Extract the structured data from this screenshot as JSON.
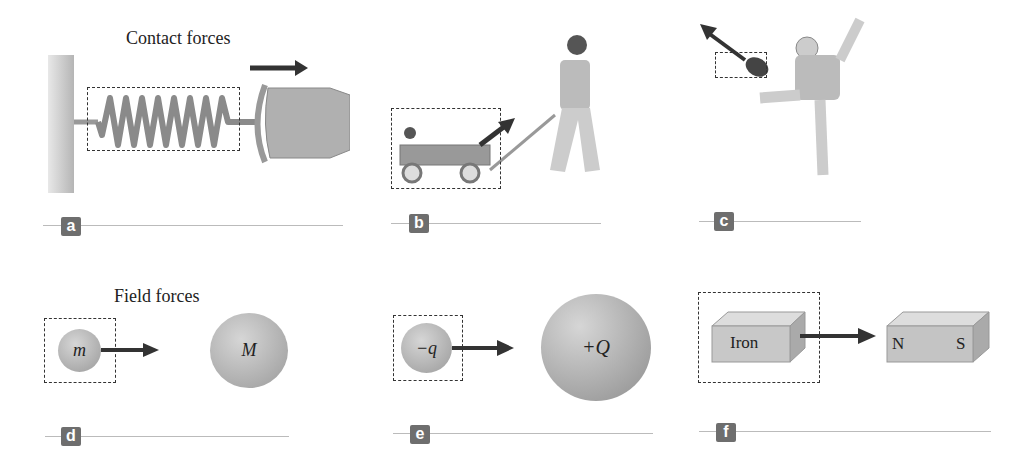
{
  "figure": {
    "contact_heading": "Contact forces",
    "field_heading": "Field forces",
    "panels": [
      {
        "id": "a",
        "label": "a",
        "description": "Hand pulling a spring attached to a wall"
      },
      {
        "id": "b",
        "label": "b",
        "description": "Person pulling a wagon with a child"
      },
      {
        "id": "c",
        "label": "c",
        "description": "Football player kicking a ball"
      },
      {
        "id": "d",
        "label": "d",
        "small_mass": "m",
        "large_mass": "M"
      },
      {
        "id": "e",
        "label": "e",
        "small_charge": "−q",
        "large_charge": "+Q"
      },
      {
        "id": "f",
        "label": "f",
        "block": "Iron",
        "magnet_north": "N",
        "magnet_south": "S"
      }
    ],
    "colors": {
      "badge": "#6e6e6e",
      "sphere": "#a8a8a8",
      "arrow": "#333333",
      "line": "#bbbbbb"
    }
  }
}
